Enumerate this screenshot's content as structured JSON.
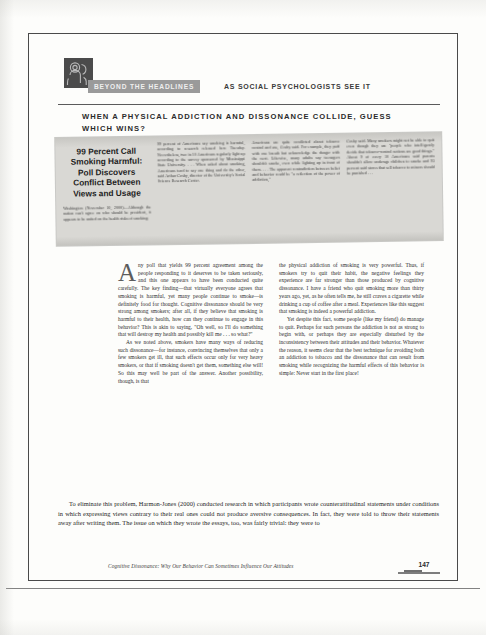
{
  "page": {
    "number": "147",
    "running_head": "Cognitive Dissonance: Why Our Behavior Can Sometimes Influence Our Attitudes"
  },
  "header": {
    "banner_label": "BEYOND THE HEADLINES",
    "subtitle": "AS SOCIAL PSYCHOLOGISTS SEE IT",
    "logo_icon": "beyond-the-headlines-emblem"
  },
  "section_title": "WHEN A PHYSICAL ADDICTION AND DISSONANCE COLLIDE, GUESS WHICH WINS?",
  "clipping": {
    "headline": "99 Percent Call Smoking Harmful: Poll Discovers Conflict Between Views and Usage",
    "columns": [
      "Washington (November 10, 2000)—Although the nation can't agree on who should be president, it appears to be united on the health risks of smoking:",
      "99 percent of Americans say smoking is harmful, according to research released here Tuesday. Nevertheless, two in 10 Americans regularly light up according to the survey sponsored by Mississippi State University. . . . When asked about smoking, Americans tend to say one thing and do the other, said Arthur Cosby, director of the University's Social Science Research Center.",
      "Americans are quite conflicted about tobacco control and use, Cosby said. For example, they puff with one breath but acknowledge the danger with the next. Likewise, many adults say teenagers shouldn't smoke, even while lighting up in front of them. . . . The apparent contradiction between belief and behavior could be \"a reflection of the power of addiction,\"",
      "Cosby said. Many smokers might not be able to quit even though they are \"people who intelligently decide that tobacco-control notions are good things.\" About 9 of every 10 Americans said parents shouldn't allow underage children to smoke and 93 percent said stores that sell tobacco to minors should be punished . . ."
    ]
  },
  "body": {
    "dropcap": "A",
    "left_column": [
      "ny poll that yields 99 percent agreement among the people responding to it deserves to be taken seriously, and this one appears to have been conducted quite carefully. The key finding—that virtually everyone agrees that smoking is harmful, yet many people continue to smoke—is definitely food for thought. Cognitive dissonance should be very strong among smokers; after all, if they believe that smoking is harmful to their health, how can they continue to engage in this behavior? This is akin to saying, \"Oh well, so I'll do something that will destroy my health and possibly kill me . . . so what?\"",
      "As we noted above, smokers have many ways of reducing such dissonance—for instance, convincing themselves that only a few smokers get ill, that such effects occur only for very heavy smokers, or that if smoking doesn't get them, something else will! So this may well be part of the answer. Another possibility, though, is that"
    ],
    "right_column": [
      "the physical addiction of smoking is very powerful. Thus, if smokers try to quit their habit, the negative feelings they experience are far stronger than those produced by cognitive dissonance. I have a friend who quit smoking more than thirty years ago, yet, as he often tells me, he still craves a cigarette while drinking a cup of coffee after a meal. Experiences like this suggest that smoking is indeed a powerful addiction.",
      "Yet despite this fact, some people (like my friend) do manage to quit. Perhaps for such persons the addiction is not as strong to begin with, or perhaps they are especially disturbed by the inconsistency between their attitudes and their behavior. Whatever the reason, it seems clear that the best technique for avoiding both an addiction to tobacco and the dissonance that can result from smoking while recognizing the harmful effects of this behavior is simple: Never start in the first place!"
    ]
  },
  "closing_paragraph": "To eliminate this problem, Harmon-Jones (2000) conducted research in which participants wrote counterattitudinal statements under conditions in which expressing views contrary to their real ones could not produce aversive consequences. In fact, they were told to throw their statements away after writing them. The issue on which they wrote the essays, too, was fairly trivial: they were to"
}
